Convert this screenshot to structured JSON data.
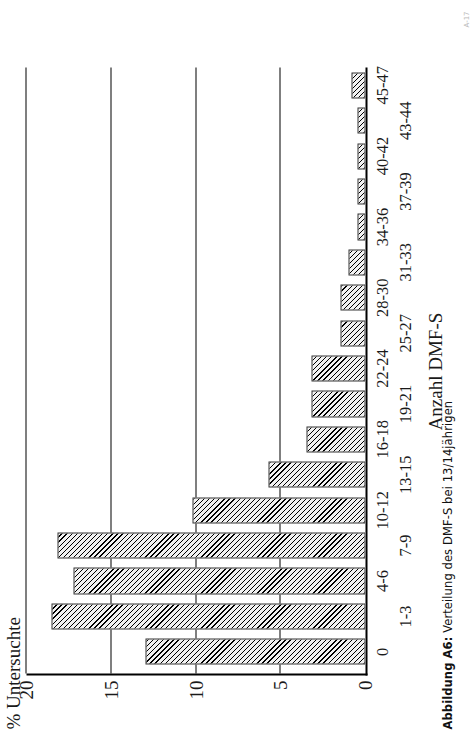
{
  "figure": {
    "caption_prefix": "Abbildung A6:",
    "caption_text": "Verteilung des DMF-S bei 13/14jährigen",
    "page_mark": "A-17"
  },
  "chart_data": {
    "type": "bar",
    "orientation": "vertical-rotated",
    "title": "",
    "xlabel": "Anzahl DMF-S",
    "ylabel": "% Untersuchte",
    "ylim": [
      0,
      20
    ],
    "yticks": [
      0,
      5,
      10,
      15,
      20
    ],
    "ytick_labels": [
      "0",
      "5",
      "10",
      "15",
      "20"
    ],
    "grid": true,
    "legend": false,
    "categories": [
      "0",
      "1-3",
      "4-6",
      "7-9",
      "10-12",
      "13-15",
      "16-18",
      "19-21",
      "22-24",
      "25-27",
      "28-30",
      "31-33",
      "34-36",
      "37-39",
      "40-42",
      "43-44",
      "45-47"
    ],
    "values": [
      13.0,
      18.5,
      17.2,
      18.2,
      10.2,
      5.7,
      3.5,
      3.2,
      3.2,
      1.5,
      1.5,
      1.0,
      0.5,
      0.5,
      0.5,
      0.5,
      0.8
    ]
  }
}
